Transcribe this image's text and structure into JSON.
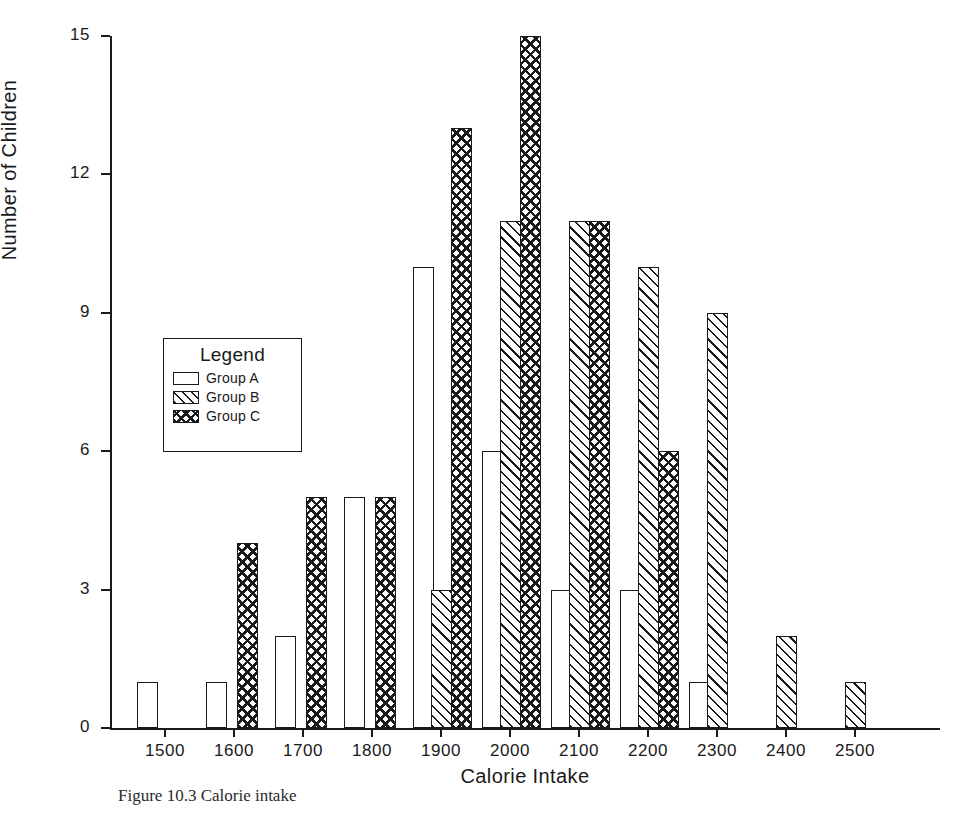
{
  "chart_data": {
    "type": "bar",
    "title": "",
    "xlabel": "Calorie Intake",
    "ylabel": "Number of Children",
    "xlim": [
      1430,
      2630
    ],
    "ylim": [
      0,
      15
    ],
    "xticks": [
      1500,
      1600,
      1700,
      1800,
      1900,
      2000,
      2100,
      2200,
      2300,
      2400,
      2500
    ],
    "yticks": [
      0,
      3,
      6,
      9,
      12,
      15
    ],
    "grid": false,
    "legend_position": "inside-left",
    "legend_title": "Legend",
    "categories": [
      1475,
      1575,
      1675,
      1775,
      1875,
      1975,
      2075,
      2175,
      2275,
      2375,
      2475
    ],
    "series": [
      {
        "name": "Group A",
        "fill": "empty",
        "values": [
          1,
          1,
          2,
          5,
          10,
          6,
          3,
          3,
          1,
          0,
          0
        ]
      },
      {
        "name": "Group B",
        "fill": "diagonal",
        "values": [
          0,
          0,
          0,
          0,
          3,
          11,
          11,
          10,
          9,
          2,
          1
        ]
      },
      {
        "name": "Group C",
        "fill": "cross-hatch",
        "values": [
          0,
          4,
          5,
          5,
          13,
          15,
          11,
          6,
          0,
          0,
          0
        ]
      }
    ],
    "bars": [
      {
        "group": "A",
        "x": 1475,
        "value": 1
      },
      {
        "group": "A",
        "x": 1575,
        "value": 1
      },
      {
        "group": "C",
        "x": 1620,
        "value": 4
      },
      {
        "group": "A",
        "x": 1675,
        "value": 2
      },
      {
        "group": "C",
        "x": 1720,
        "value": 5
      },
      {
        "group": "A",
        "x": 1775,
        "value": 5
      },
      {
        "group": "C",
        "x": 1820,
        "value": 5
      },
      {
        "group": "A",
        "x": 1875,
        "value": 10
      },
      {
        "group": "B",
        "x": 1900,
        "value": 3
      },
      {
        "group": "C",
        "x": 1930,
        "value": 13
      },
      {
        "group": "A",
        "x": 1975,
        "value": 6
      },
      {
        "group": "B",
        "x": 2000,
        "value": 11
      },
      {
        "group": "C",
        "x": 2030,
        "value": 15
      },
      {
        "group": "A",
        "x": 2075,
        "value": 3
      },
      {
        "group": "B",
        "x": 2100,
        "value": 11
      },
      {
        "group": "C",
        "x": 2130,
        "value": 11
      },
      {
        "group": "A",
        "x": 2175,
        "value": 3
      },
      {
        "group": "B",
        "x": 2200,
        "value": 10
      },
      {
        "group": "C",
        "x": 2230,
        "value": 6
      },
      {
        "group": "A",
        "x": 2275,
        "value": 1
      },
      {
        "group": "B",
        "x": 2300,
        "value": 9
      },
      {
        "group": "B",
        "x": 2400,
        "value": 2
      },
      {
        "group": "B",
        "x": 2500,
        "value": 1
      }
    ]
  },
  "legend": {
    "title": "Legend",
    "entries": [
      {
        "label": "Group A",
        "pattern": "empty"
      },
      {
        "label": "Group B",
        "pattern": "diagonal"
      },
      {
        "label": "Group C",
        "pattern": "cross-hatch"
      }
    ]
  },
  "caption": {
    "text": "Figure 10.3   Calorie intake"
  },
  "colors": {
    "ink": "#1a1a1a",
    "background": "#ffffff"
  }
}
